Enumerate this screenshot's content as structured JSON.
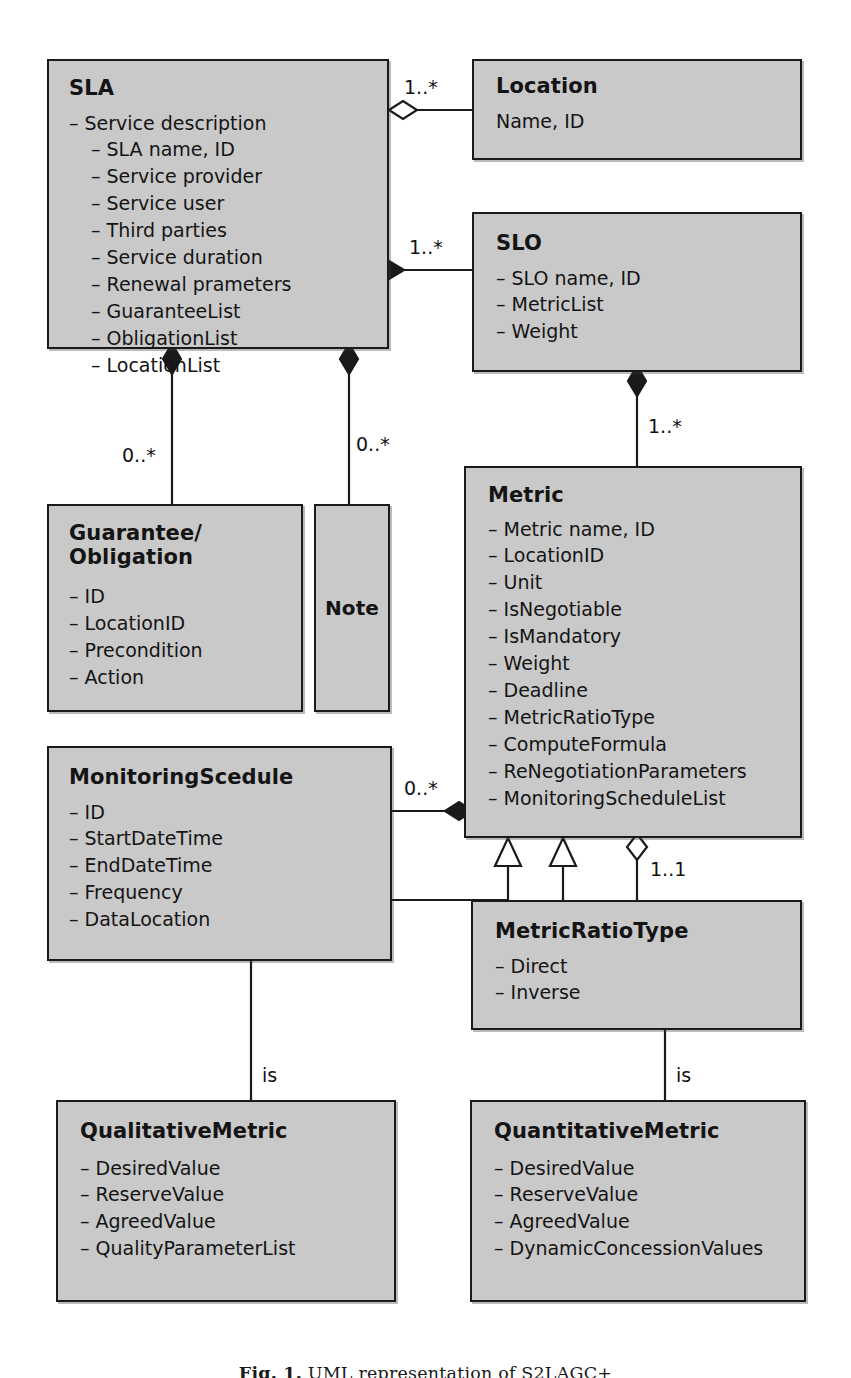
{
  "diagram": {
    "type": "uml-class-diagram",
    "caption": "Fig. 1. UML representation of S2LAGC+",
    "caption_label": "Fig. 1.",
    "caption_text": "UML representation of S2LAGC+"
  },
  "classes": {
    "sla": {
      "name": "SLA",
      "attributes": [
        "– Service description",
        "– SLA name, ID",
        "– Service provider",
        "– Service user",
        "– Third parties",
        "– Service duration",
        "– Renewal prameters",
        "– GuaranteeList",
        "– ObligationList",
        "– LocationList"
      ]
    },
    "location": {
      "name": "Location",
      "attributes": [
        "Name, ID"
      ]
    },
    "slo": {
      "name": "SLO",
      "attributes": [
        "– SLO name, ID",
        "– MetricList",
        "– Weight"
      ]
    },
    "guarantee_obligation": {
      "name": "Guarantee/\nObligation",
      "attributes": [
        "– ID",
        "– LocationID",
        "– Precondition",
        "– Action"
      ]
    },
    "note": {
      "name": "Note",
      "attributes": []
    },
    "metric": {
      "name": "Metric",
      "attributes": [
        "– Metric name, ID",
        "– LocationID",
        "– Unit",
        "– IsNegotiable",
        "– IsMandatory",
        "– Weight",
        "– Deadline",
        "– MetricRatioType",
        "– ComputeFormula",
        "– ReNegotiationParameters",
        "– MonitoringScheduleList"
      ]
    },
    "monitoring_scedule": {
      "name": "MonitoringScedule",
      "attributes": [
        "– ID",
        "– StartDateTime",
        "– EndDateTime",
        "– Frequency",
        "– DataLocation"
      ]
    },
    "metric_ratio_type": {
      "name": "MetricRatioType",
      "attributes": [
        "– Direct",
        "– Inverse"
      ]
    },
    "qualitative_metric": {
      "name": "QualitativeMetric",
      "attributes": [
        "– DesiredValue",
        "– ReserveValue",
        "– AgreedValue",
        "– QualityParameterList"
      ]
    },
    "quantitative_metric": {
      "name": "QuantitativeMetric",
      "attributes": [
        "– DesiredValue",
        "– ReserveValue",
        "– AgreedValue",
        "– DynamicConcessionValues"
      ]
    }
  },
  "relations": {
    "sla_location": {
      "multiplicity": "1..*",
      "kind": "aggregation"
    },
    "sla_slo": {
      "multiplicity": "1..*",
      "kind": "composition"
    },
    "slo_metric": {
      "multiplicity": "1..*",
      "kind": "composition"
    },
    "sla_guarantee": {
      "multiplicity": "0..*",
      "kind": "composition"
    },
    "sla_note": {
      "multiplicity": "0..*",
      "kind": "composition"
    },
    "monitoring_metric": {
      "multiplicity": "0..*",
      "kind": "composition"
    },
    "metric_ratiotype": {
      "multiplicity": "1..1",
      "kind": "aggregation"
    },
    "metric_qualitative": {
      "label": "is",
      "kind": "generalization"
    },
    "metric_quantitative": {
      "label": "is",
      "kind": "generalization"
    }
  },
  "colors": {
    "box_fill": "#c9c9c9",
    "box_border": "#1a1a1a",
    "line": "#1a1a1a",
    "text": "#141414",
    "page_bg": "#ffffff"
  }
}
